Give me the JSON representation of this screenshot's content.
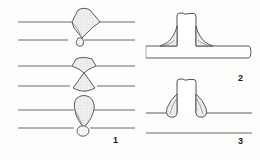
{
  "figure": {
    "background_color": "#fdfdfc",
    "line_color": "#5a5a5a",
    "outline_color": "#4a4a4a",
    "weld_fill_color": "#efefef",
    "label_color": "#1a1a1a",
    "panels": [
      {
        "id": "panel-1",
        "label": "1",
        "label_x": 113,
        "label_y": 136,
        "description": "butt-weld-bead-profiles",
        "joints": [
          {
            "name": "excess-reinforcement-butt-weld",
            "plate_top_y": 22,
            "plate_bottom_y": 40,
            "plate_x_start": 18,
            "plate_x_end": 135,
            "bead_shape": "wide-fan-trapezoid",
            "root_bead": "small-teardrop"
          },
          {
            "name": "hourglass-butt-weld",
            "plate_top_y": 66,
            "plate_bottom_y": 86,
            "plate_x_start": 18,
            "plate_x_end": 135,
            "bead_shape": "bowtie-hourglass",
            "root_bead": "flared-cone"
          },
          {
            "name": "rounded-crown-butt-weld",
            "plate_top_y": 110,
            "plate_bottom_y": 128,
            "plate_x_start": 18,
            "plate_x_end": 135,
            "bead_shape": "rounded-dome",
            "root_bead": "small-round-drop"
          }
        ]
      },
      {
        "id": "panel-2",
        "label": "2",
        "label_x": 238,
        "label_y": 74,
        "description": "tee-joint-concave-fillet-weld",
        "vertical_member": {
          "x_left": 177,
          "x_right": 196,
          "y_top": 13,
          "y_bottom": 46
        },
        "base_plate": {
          "x_start": 146,
          "x_end": 252,
          "y_top": 46,
          "y_bottom": 58
        },
        "fillet_profile": "concave"
      },
      {
        "id": "panel-3",
        "label": "3",
        "label_x": 238,
        "label_y": 137,
        "description": "tee-joint-convex-fillet-weld",
        "vertical_member": {
          "x_left": 177,
          "x_right": 196,
          "y_top": 79,
          "y_bottom": 113
        },
        "base_plate": {
          "x_start": 146,
          "x_end": 252,
          "y_top": 113,
          "y_bottom": 113
        },
        "lower_reference_line_y": 133,
        "fillet_profile": "convex"
      }
    ]
  }
}
